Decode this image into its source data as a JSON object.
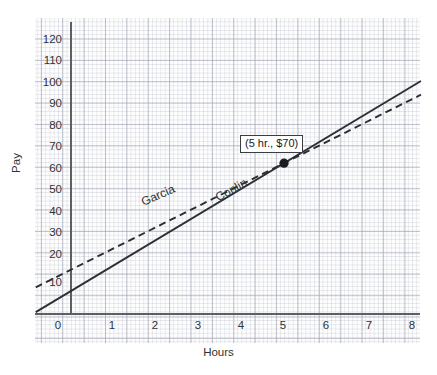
{
  "chart_data": {
    "type": "line",
    "title": "",
    "xlabel": "Hours",
    "ylabel": "Pay",
    "xlim": [
      -0.8,
      8.2
    ],
    "ylim": [
      0,
      128
    ],
    "grid": true,
    "grid_style": "graph-paper",
    "legend": "inline-labels",
    "xticks": [
      0,
      1,
      2,
      3,
      4,
      5,
      6,
      7,
      8
    ],
    "yticks": [
      10,
      20,
      30,
      40,
      50,
      60,
      70,
      80,
      90,
      100,
      110,
      120
    ],
    "series": [
      {
        "name": "Conlin",
        "style": "solid",
        "color": "#2b2e33",
        "intercept": 10,
        "slope": 12,
        "x": [
          -0.8,
          0,
          1,
          2,
          3,
          4,
          5,
          6,
          7,
          8.2
        ],
        "values": [
          0.4,
          10,
          22,
          34,
          46,
          58,
          70,
          82,
          94,
          108.4
        ]
      },
      {
        "name": "Garcia",
        "style": "dashed",
        "color": "#2b2e33",
        "intercept": 20,
        "slope": 10,
        "x": [
          -0.8,
          0,
          1,
          2,
          3,
          4,
          5,
          6,
          7,
          8.2
        ],
        "values": [
          12,
          20,
          30,
          40,
          50,
          60,
          70,
          80,
          90,
          102
        ]
      }
    ],
    "annotations": [
      {
        "label": "(5 hr., $70)",
        "x": 5,
        "y": 70,
        "marker": "filled-circle"
      }
    ]
  },
  "axes": {
    "x_title": "Hours",
    "y_title": "Pay",
    "x_tick_labels": [
      "0",
      "1",
      "2",
      "3",
      "4",
      "5",
      "6",
      "7",
      "8"
    ],
    "y_tick_labels": [
      "10",
      "20",
      "30",
      "40",
      "50",
      "60",
      "70",
      "80",
      "90",
      "100",
      "110",
      "120"
    ]
  },
  "series_labels": {
    "garcia": "Garcia",
    "conlin": "Conlin"
  },
  "callout": {
    "text": "(5 hr., $70)"
  },
  "colors": {
    "line": "#2b2e33",
    "axis": "#5b5f66",
    "grid_major": "#969baa",
    "grid_minor": "#afb4c3",
    "text": "#2f3237",
    "paper": "#fdfdfd"
  }
}
